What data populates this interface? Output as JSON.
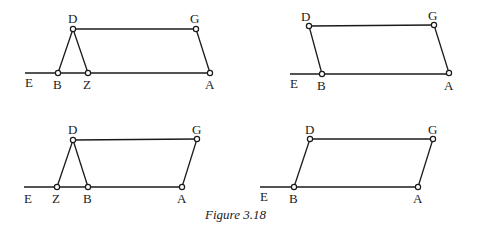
{
  "caption": "Figure 3.18",
  "colors": {
    "ink": "#1a1a1a",
    "background": "#ffffff"
  },
  "panels": [
    {
      "id": "top-left",
      "line_start": [
        25,
        73
      ],
      "points": {
        "D": {
          "xy": [
            73,
            29
          ],
          "label": "D",
          "lx": 68,
          "ly": 23
        },
        "G": {
          "xy": [
            196,
            29
          ],
          "label": "G",
          "lx": 190,
          "ly": 23
        },
        "B": {
          "xy": [
            58,
            73
          ],
          "label": "B",
          "lx": 53,
          "ly": 89
        },
        "Z": {
          "xy": [
            88,
            73
          ],
          "label": "Z",
          "lx": 83,
          "ly": 89
        },
        "A": {
          "xy": [
            210,
            73
          ],
          "label": "A",
          "lx": 205,
          "ly": 89
        },
        "E": {
          "label": "E",
          "lx": 25,
          "ly": 87
        }
      },
      "segments": [
        [
          "D",
          "G"
        ],
        [
          "D",
          "B"
        ],
        [
          "D",
          "Z"
        ],
        [
          "G",
          "A"
        ]
      ]
    },
    {
      "id": "top-right",
      "line_start": [
        290,
        74
      ],
      "points": {
        "D": {
          "xy": [
            309,
            26
          ],
          "label": "D",
          "lx": 301,
          "ly": 21
        },
        "G": {
          "xy": [
            434,
            25
          ],
          "label": "G",
          "lx": 428,
          "ly": 20
        },
        "B": {
          "xy": [
            322,
            74
          ],
          "label": "B",
          "lx": 317,
          "ly": 90
        },
        "A": {
          "xy": [
            449,
            73
          ],
          "label": "A",
          "lx": 444,
          "ly": 90
        },
        "E": {
          "label": "E",
          "lx": 290,
          "ly": 88
        }
      },
      "segments": [
        [
          "D",
          "G"
        ],
        [
          "D",
          "B"
        ],
        [
          "G",
          "A"
        ]
      ]
    },
    {
      "id": "bottom-left",
      "line_start": [
        24,
        187
      ],
      "points": {
        "D": {
          "xy": [
            73,
            140
          ],
          "label": "D",
          "lx": 68,
          "ly": 134
        },
        "G": {
          "xy": [
            197,
            139
          ],
          "label": "G",
          "lx": 192,
          "ly": 134
        },
        "Z": {
          "xy": [
            57,
            187
          ],
          "label": "Z",
          "lx": 52,
          "ly": 203
        },
        "B": {
          "xy": [
            88,
            187
          ],
          "label": "B",
          "lx": 83,
          "ly": 203
        },
        "A": {
          "xy": [
            182,
            187
          ],
          "label": "A",
          "lx": 177,
          "ly": 203
        },
        "E": {
          "label": "E",
          "lx": 24,
          "ly": 203
        }
      },
      "segments": [
        [
          "D",
          "G"
        ],
        [
          "D",
          "Z"
        ],
        [
          "D",
          "B"
        ],
        [
          "G",
          "A"
        ]
      ]
    },
    {
      "id": "bottom-right",
      "line_start": [
        260,
        187
      ],
      "points": {
        "D": {
          "xy": [
            310,
            139
          ],
          "label": "D",
          "lx": 305,
          "ly": 134
        },
        "G": {
          "xy": [
            433,
            139
          ],
          "label": "G",
          "lx": 428,
          "ly": 134
        },
        "B": {
          "xy": [
            294,
            187
          ],
          "label": "B",
          "lx": 289,
          "ly": 203
        },
        "A": {
          "xy": [
            418,
            187
          ],
          "label": "A",
          "lx": 413,
          "ly": 203
        },
        "E": {
          "label": "E",
          "lx": 260,
          "ly": 201
        }
      },
      "segments": [
        [
          "D",
          "G"
        ],
        [
          "D",
          "B"
        ],
        [
          "G",
          "A"
        ]
      ]
    }
  ]
}
